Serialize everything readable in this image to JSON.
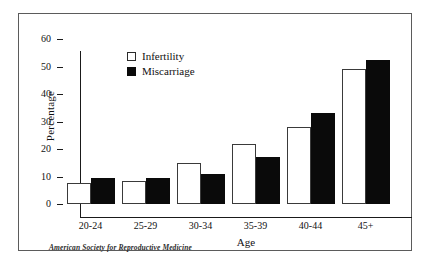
{
  "chart_data": {
    "type": "bar",
    "title": "",
    "xlabel": "Age",
    "ylabel": "Percentage",
    "ylim": [
      0,
      60
    ],
    "yticks": [
      0,
      10,
      20,
      30,
      40,
      50,
      60
    ],
    "grid": false,
    "legend_position": "top-left-inside",
    "categories": [
      "20-24",
      "25-29",
      "30-34",
      "35-39",
      "40-44",
      "45+"
    ],
    "series": [
      {
        "name": "Infertility",
        "swatch": "open-square",
        "color": "#ffffff",
        "edge_color": "#3a3a3a",
        "values": [
          7.5,
          8.5,
          15,
          22,
          28,
          49
        ]
      },
      {
        "name": "Miscarriage",
        "swatch": "filled-square",
        "color": "#0a0a0a",
        "edge_color": "#0a0a0a",
        "values": [
          9.5,
          9.5,
          11,
          17,
          33,
          52.5
        ]
      }
    ],
    "source_note": "American Society for Reproductive Medicine"
  },
  "figure": {
    "background": "#ffffff",
    "frame_color": "#5b5b5b",
    "axis_color": "#1a1a1a"
  }
}
